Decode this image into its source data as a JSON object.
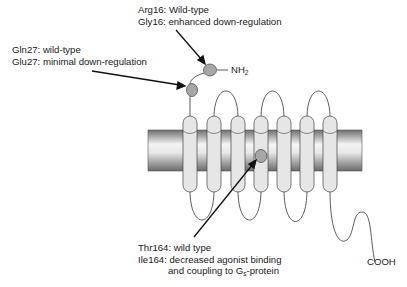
{
  "diagram": {
    "type": "GPCR membrane topology (beta2-adrenergic receptor polymorphisms)",
    "termini": {
      "n_terminus": {
        "label": "NH",
        "subscript": "2"
      },
      "c_terminus": {
        "label": "COOH"
      }
    },
    "helices_count": 7,
    "colors": {
      "membrane_light": "#f2f2f2",
      "membrane_dark": "#7a7a7a",
      "helix_fill": "#e6e6e6",
      "site_fill": "#a6a6a6",
      "line": "#333333"
    },
    "annotations": [
      {
        "id": "pos16",
        "line1": "Arg16: Wild-type",
        "line2": "Gly16: enhanced down-regulation"
      },
      {
        "id": "pos27",
        "line1": "Gln27: wild-type",
        "line2": "Glu27: minimal down-regulation"
      },
      {
        "id": "pos164",
        "line1": "Thr164: wild type",
        "line2": "Ile164: decreased agonist binding",
        "line3_pre": "and coupling to G",
        "line3_sub": "s",
        "line3_post": "-protein"
      }
    ]
  }
}
